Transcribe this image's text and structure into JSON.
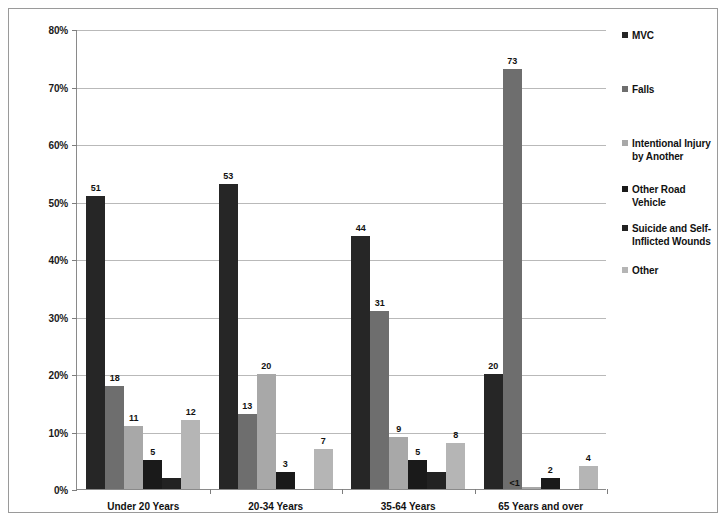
{
  "chart_data": {
    "type": "bar",
    "title": "",
    "xlabel": "",
    "ylabel": "",
    "ylim": [
      0,
      80
    ],
    "grid": true,
    "legend_position": "right",
    "y_ticks": [
      "0%",
      "10%",
      "20%",
      "30%",
      "40%",
      "50%",
      "60%",
      "70%",
      "80%"
    ],
    "categories": [
      "Under 20 Years",
      "20-34 Years",
      "35-64 Years",
      "65 Years and over"
    ],
    "series": [
      {
        "name": "MVC",
        "color": "#262626",
        "values": [
          51,
          53,
          44,
          20
        ],
        "labels": [
          "51",
          "53",
          "44",
          "20"
        ]
      },
      {
        "name": "Falls",
        "color": "#6e6e6e",
        "values": [
          18,
          13,
          31,
          73
        ],
        "labels": [
          "18",
          "13",
          "31",
          "73"
        ]
      },
      {
        "name": "Intentional Injury by Another",
        "color": "#a8a8a8",
        "values": [
          11,
          20,
          9,
          0.4
        ],
        "labels": [
          "11",
          "20",
          "9",
          "<1"
        ]
      },
      {
        "name": "Other Road Vehicle",
        "color": "#1a1a1a",
        "values": [
          5,
          3,
          5,
          2
        ],
        "labels": [
          "5",
          "3",
          "5",
          "2"
        ]
      },
      {
        "name": "Suicide and Self-Inflicted Wounds",
        "color": "#222222",
        "values": [
          2,
          0,
          3,
          0
        ],
        "labels": [
          "",
          "",
          "",
          ""
        ]
      },
      {
        "name": "Other",
        "color": "#b5b5b5",
        "values": [
          12,
          7,
          8,
          4
        ],
        "labels": [
          "12",
          "7",
          "8",
          "4"
        ]
      }
    ]
  },
  "legend": {
    "items": [
      {
        "label": "MVC",
        "color": "#262626"
      },
      {
        "label": "Falls",
        "color": "#6e6e6e"
      },
      {
        "label": "Intentional Injury by Another",
        "color": "#a8a8a8"
      },
      {
        "label": "Other Road Vehicle",
        "color": "#1a1a1a"
      },
      {
        "label": "Suicide and Self-Inflicted Wounds",
        "color": "#222222"
      },
      {
        "label": "Other",
        "color": "#b5b5b5"
      }
    ]
  }
}
